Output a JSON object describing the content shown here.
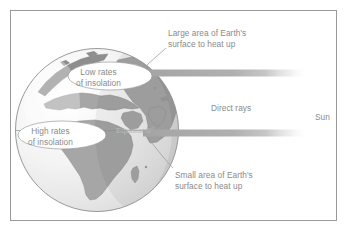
{
  "figure": {
    "frame_color": "#9a9a9a",
    "background": "#ffffff"
  },
  "globe": {
    "name": "earth-globe",
    "ocean_color": "#e8e8e8",
    "land_color": "#a8a8a8",
    "outline_color": "#8f8f8f",
    "highlight_color": "#fbfbfb",
    "center": {
      "x": 97,
      "y": 130
    },
    "radius": 82
  },
  "rays": {
    "color": "#b0b0b0",
    "label": "Direct rays",
    "upper_band": {
      "x": 143,
      "y": 70,
      "width": 165,
      "height": 7
    },
    "lower_band": {
      "x": 143,
      "y": 130,
      "width": 165,
      "height": 7
    }
  },
  "labels": {
    "large_area": "Large area of Earth's\nsurface to heat up",
    "large_area_line1": "Large area of Earth's",
    "large_area_line2": "surface to heat up",
    "small_area_line1": "Small area of Earth's",
    "small_area_line2": "surface to heat up",
    "direct_rays": "Direct rays",
    "sun": "Sun",
    "low_rates_line1": "Low rates",
    "low_rates_line2": "of insolation",
    "high_rates_line1": "High rates",
    "high_rates_line2": "of insolation",
    "equator": "Equator 0°",
    "text_color": "#8a8a8a"
  },
  "callouts": [
    {
      "name": "low-rates-callout",
      "fill": "#ffffff",
      "stroke": "#9b9b9b"
    },
    {
      "name": "high-rates-callout",
      "fill": "#ffffff",
      "stroke": "#9b9b9b"
    }
  ],
  "leader_lines": {
    "color": "#9b9b9b",
    "count": 2
  }
}
